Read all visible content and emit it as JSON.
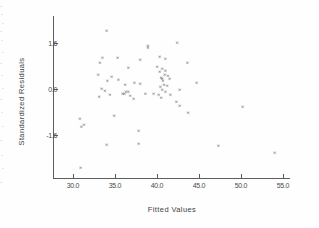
{
  "chart_data": {
    "type": "scatter",
    "title": "",
    "xlabel": "Fitted Values",
    "ylabel": "Standardized Residuals",
    "xlim": [
      28.5,
      56.5
    ],
    "ylim": [
      -3.0,
      2.4
    ],
    "xticks": [
      "30.0",
      "35.0",
      "40.0",
      "45.0",
      "50.0",
      "55.0"
    ],
    "xtick_values": [
      30.0,
      35.0,
      40.0,
      45.0,
      50.0,
      55.0
    ],
    "yticks": [
      "1.6",
      "0.0",
      "-1.6"
    ],
    "ytick_values": [
      1.6,
      0.0,
      -1.6
    ],
    "grid": false,
    "legend": null,
    "marker": "x",
    "marker_glyph": "×",
    "marker_color": "#2b2b2b",
    "axis_color": "#5d5d5d",
    "background_color": "#fefefe",
    "points": [
      {
        "x": 34.0,
        "y": 2.05
      },
      {
        "x": 42.4,
        "y": 1.62
      },
      {
        "x": 38.9,
        "y": 1.52
      },
      {
        "x": 38.9,
        "y": 1.45
      },
      {
        "x": 33.5,
        "y": 1.1
      },
      {
        "x": 35.3,
        "y": 1.08
      },
      {
        "x": 40.3,
        "y": 1.12
      },
      {
        "x": 41.0,
        "y": 1.05
      },
      {
        "x": 38.0,
        "y": 1.02
      },
      {
        "x": 33.2,
        "y": 0.92
      },
      {
        "x": 43.6,
        "y": 0.92
      },
      {
        "x": 40.0,
        "y": 0.78
      },
      {
        "x": 40.6,
        "y": 0.72
      },
      {
        "x": 36.6,
        "y": 0.74
      },
      {
        "x": 41.0,
        "y": 0.66
      },
      {
        "x": 40.3,
        "y": 0.6
      },
      {
        "x": 33.0,
        "y": 0.52
      },
      {
        "x": 40.9,
        "y": 0.52
      },
      {
        "x": 41.3,
        "y": 0.48
      },
      {
        "x": 34.6,
        "y": 0.42
      },
      {
        "x": 40.5,
        "y": 0.4
      },
      {
        "x": 40.6,
        "y": 0.36
      },
      {
        "x": 35.4,
        "y": 0.33
      },
      {
        "x": 40.7,
        "y": 0.3
      },
      {
        "x": 41.5,
        "y": 0.35
      },
      {
        "x": 34.1,
        "y": 0.28
      },
      {
        "x": 37.3,
        "y": 0.22
      },
      {
        "x": 44.7,
        "y": 0.22
      },
      {
        "x": 38.0,
        "y": 0.2
      },
      {
        "x": 40.8,
        "y": 0.16
      },
      {
        "x": 41.2,
        "y": 0.12
      },
      {
        "x": 36.2,
        "y": 0.14
      },
      {
        "x": 40.4,
        "y": 0.08
      },
      {
        "x": 33.4,
        "y": 0.02
      },
      {
        "x": 42.7,
        "y": 0.0
      },
      {
        "x": 40.6,
        "y": -0.02
      },
      {
        "x": 33.8,
        "y": -0.06
      },
      {
        "x": 41.0,
        "y": -0.08
      },
      {
        "x": 36.3,
        "y": -0.1
      },
      {
        "x": 36.6,
        "y": -0.1
      },
      {
        "x": 35.9,
        "y": -0.14
      },
      {
        "x": 36.1,
        "y": -0.16
      },
      {
        "x": 38.6,
        "y": -0.14
      },
      {
        "x": 39.6,
        "y": -0.16
      },
      {
        "x": 34.4,
        "y": -0.18
      },
      {
        "x": 40.2,
        "y": -0.2
      },
      {
        "x": 41.6,
        "y": -0.18
      },
      {
        "x": 33.1,
        "y": -0.26
      },
      {
        "x": 36.8,
        "y": -0.24
      },
      {
        "x": 40.5,
        "y": -0.3
      },
      {
        "x": 37.2,
        "y": -0.32
      },
      {
        "x": 42.3,
        "y": -0.42
      },
      {
        "x": 42.7,
        "y": -0.56
      },
      {
        "x": 50.2,
        "y": -0.62
      },
      {
        "x": 43.7,
        "y": -0.8
      },
      {
        "x": 30.8,
        "y": -1.02
      },
      {
        "x": 34.9,
        "y": -0.92
      },
      {
        "x": 31.3,
        "y": -1.22
      },
      {
        "x": 31.0,
        "y": -1.3
      },
      {
        "x": 37.8,
        "y": -1.45
      },
      {
        "x": 37.8,
        "y": -1.88
      },
      {
        "x": 34.0,
        "y": -1.92
      },
      {
        "x": 47.3,
        "y": -1.96
      },
      {
        "x": 54.0,
        "y": -2.22
      },
      {
        "x": 30.9,
        "y": -2.72
      }
    ]
  },
  "figure": {
    "xaxis_title": "Fitted Values",
    "yaxis_title": "Standardized Residuals"
  }
}
